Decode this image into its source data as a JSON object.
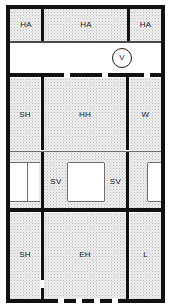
{
  "diagram": {
    "type": "floor-plan",
    "width": 170,
    "height": 308,
    "colors": {
      "wall": "#111111",
      "room_fill": "#eeeeee",
      "void_fill": "#ffffff",
      "text": "#1a1a1a"
    },
    "rooms": [
      {
        "id": "ha-left",
        "label": "HA",
        "x": 10,
        "y": 8,
        "w": 32,
        "h": 33
      },
      {
        "id": "ha-center",
        "label": "HA",
        "x": 44,
        "y": 8,
        "w": 84,
        "h": 33
      },
      {
        "id": "ha-right",
        "label": "HA",
        "x": 130,
        "y": 8,
        "w": 31,
        "h": 33
      },
      {
        "id": "sh-upper",
        "label": "SH",
        "x": 10,
        "y": 78,
        "w": 30,
        "h": 73
      },
      {
        "id": "hh",
        "label": "HH",
        "x": 44,
        "y": 78,
        "w": 82,
        "h": 73
      },
      {
        "id": "w",
        "label": "W",
        "x": 130,
        "y": 78,
        "w": 31,
        "h": 73
      },
      {
        "id": "sv-void-1",
        "label": "",
        "x": 10,
        "y": 163,
        "w": 17,
        "h": 38,
        "void": true
      },
      {
        "id": "sv-left",
        "label": "SV",
        "x": 45,
        "y": 163,
        "w": 22,
        "h": 38
      },
      {
        "id": "sv-void-2",
        "label": "",
        "x": 68,
        "y": 163,
        "w": 36,
        "h": 38,
        "void": true
      },
      {
        "id": "sv-right",
        "label": "SV",
        "x": 105,
        "y": 163,
        "w": 21,
        "h": 38
      },
      {
        "id": "sv-void-3",
        "label": "",
        "x": 148,
        "y": 163,
        "w": 13,
        "h": 38,
        "void": true
      },
      {
        "id": "sh-lower",
        "label": "SH",
        "x": 10,
        "y": 213,
        "w": 30,
        "h": 86
      },
      {
        "id": "eh",
        "label": "EH",
        "x": 44,
        "y": 213,
        "w": 82,
        "h": 86
      },
      {
        "id": "l",
        "label": "L",
        "x": 130,
        "y": 213,
        "w": 31,
        "h": 86
      }
    ],
    "symbols": [
      {
        "id": "vent-symbol",
        "label": "V",
        "x": 112,
        "y": 48,
        "size": 18
      }
    ]
  }
}
